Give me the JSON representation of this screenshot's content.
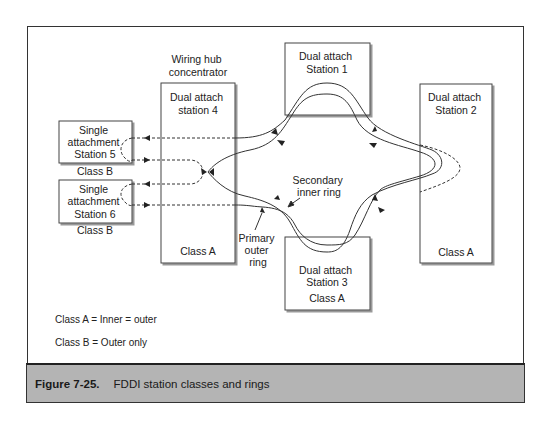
{
  "diagram": {
    "hub_label": [
      "Wiring hub",
      "concentrator"
    ],
    "stations": {
      "station1": {
        "lines": [
          "Dual attach",
          "Station 1"
        ]
      },
      "station2": {
        "lines": [
          "Dual attach",
          "Station 2"
        ],
        "class": "Class A"
      },
      "station3": {
        "lines": [
          "Dual attach",
          "Station 3"
        ],
        "class": "Class A"
      },
      "station4": {
        "lines": [
          "Dual attach",
          "station 4"
        ],
        "class": "Class A"
      },
      "station5": {
        "lines": [
          "Single",
          "attachment",
          "Station 5"
        ],
        "class": "Class B"
      },
      "station6": {
        "lines": [
          "Single",
          "attachment",
          "Station 6"
        ],
        "class": "Class B"
      }
    },
    "annotations": {
      "secondary": [
        "Secondary",
        "inner ring"
      ],
      "primary": [
        "Primary",
        "outer",
        "ring"
      ]
    },
    "legend": {
      "class_a": "Class A = Inner = outer",
      "class_b": "Class B = Outer only"
    }
  },
  "caption": {
    "number": "Figure 7-25.",
    "title": "FDDI station classes and rings"
  }
}
